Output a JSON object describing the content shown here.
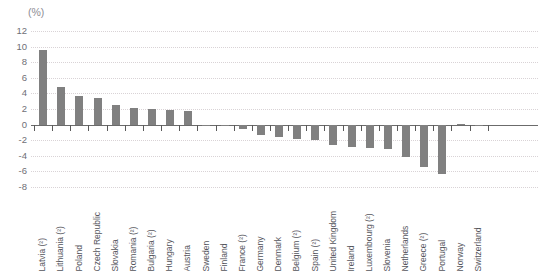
{
  "title": "",
  "unit_label": "(%)",
  "axis": {
    "y_ticks": [
      "12",
      "10",
      "8",
      "6",
      "4",
      "2",
      "0",
      "-2",
      "-4",
      "-6",
      "-8"
    ]
  },
  "chart_data": {
    "type": "bar",
    "title": "",
    "subtitle": "",
    "xlabel": "",
    "ylabel": "(%)",
    "ylim": [
      -8,
      12
    ],
    "ytick_values": [
      12,
      10,
      8,
      6,
      4,
      2,
      0,
      -2,
      -4,
      -6,
      -8
    ],
    "grid": true,
    "legend": "none",
    "bar_color": "#808080",
    "zero_line_color": "#6b6b6b",
    "gridline_color": "#d9d3d6",
    "categories": [
      "Latvia (²)",
      "Lithuania (²)",
      "Poland",
      "Czech Republic",
      "Slovakia",
      "Romania (²)",
      "Bulgaria (²)",
      "Hungary",
      "Austria",
      "Sweden",
      "Finland",
      "France (²)",
      "Germany",
      "Denmark",
      "Belgium (²)",
      "Spain (²)",
      "United Kingdom",
      "Ireland",
      "Luxembourg (²)",
      "Slovenia",
      "Netherlands",
      "Greece (²)",
      "Portugal",
      "Norway",
      "Switzerland"
    ],
    "values": [
      9.6,
      4.8,
      3.65,
      3.45,
      2.5,
      2.1,
      2.0,
      1.85,
      1.8,
      0.0,
      -0.15,
      -0.55,
      -1.3,
      -1.6,
      -1.9,
      -2.0,
      -2.6,
      -2.9,
      -3.0,
      -3.1,
      -4.1,
      -5.4,
      -6.3,
      0.1,
      0.0
    ]
  }
}
